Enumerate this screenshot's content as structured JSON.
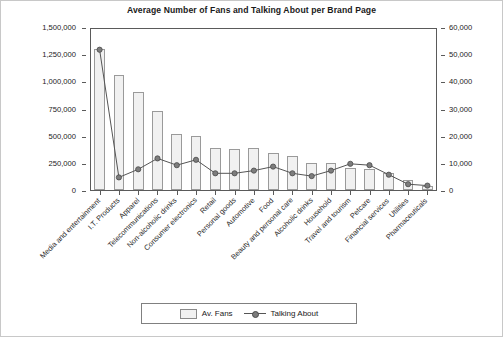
{
  "chart_data": {
    "type": "bar",
    "title": "Average Number of Fans and Talking About per Brand Page",
    "xlabel": "",
    "ylabel": "",
    "grid": false,
    "legend_position": "bottom-center",
    "categories": [
      "Media and entertainment",
      "I.T. Products",
      "Apparel",
      "Telecommunications",
      "Non-alcoholic drinks",
      "Consumer electronics",
      "Retail",
      "Personal goods",
      "Automotive",
      "Food",
      "Beauty and personal care",
      "Alcoholic drinks",
      "Household",
      "Travel and tourism",
      "Petcare",
      "Financial services",
      "Utilities",
      "Pharmaceuticals"
    ],
    "series": [
      {
        "name": "Av. Fans",
        "axis": "left",
        "type": "bar",
        "values": [
          1300000,
          1060000,
          900000,
          730000,
          520000,
          500000,
          390000,
          380000,
          385000,
          340000,
          310000,
          250000,
          250000,
          200000,
          190000,
          160000,
          90000,
          40000
        ]
      },
      {
        "name": "Talking About",
        "axis": "right",
        "type": "line",
        "values": [
          52000,
          5000,
          8000,
          12000,
          9500,
          11500,
          6500,
          6500,
          7500,
          9000,
          6500,
          5500,
          7500,
          10000,
          9500,
          6000,
          2500,
          2000
        ]
      }
    ],
    "left_axis": {
      "min": 0,
      "max": 1500000,
      "step": 250000,
      "ticks": [
        "0",
        "250,000",
        "500,000",
        "750,000",
        "1,000,000",
        "1,250,000",
        "1,500,000"
      ]
    },
    "right_axis": {
      "min": 0,
      "max": 60000,
      "step": 10000,
      "ticks": [
        "0",
        "10,000",
        "20,000",
        "30,000",
        "40,000",
        "50,000",
        "60,000"
      ]
    }
  },
  "legend": {
    "items": [
      {
        "label": "Av. Fans",
        "marker": "bar-swatch"
      },
      {
        "label": "Talking About",
        "marker": "line-circle"
      }
    ]
  },
  "colors": {
    "bar_fill": "#f1f1f1",
    "bar_stroke": "#9a9a9a",
    "line": "#555555",
    "marker_fill": "#7d7d7d",
    "axis": "#5a5a5a",
    "text": "#1a1a1a",
    "background": "#ffffff"
  }
}
